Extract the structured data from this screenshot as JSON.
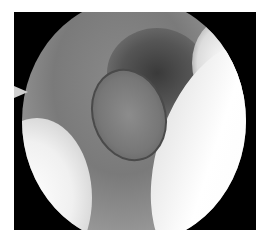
{
  "image": {
    "type": "endoscopic-view",
    "description": "Grayscale circular arthroscopic/endoscopic field of view on black background showing a cylindrical implant-like structure surrounded by tissue",
    "colors": {
      "background": "#000000",
      "page": "#ffffff",
      "tissue_mid": "#8a8a8a",
      "highlight": "#ffffff",
      "shadow": "#3a3a3a"
    }
  }
}
